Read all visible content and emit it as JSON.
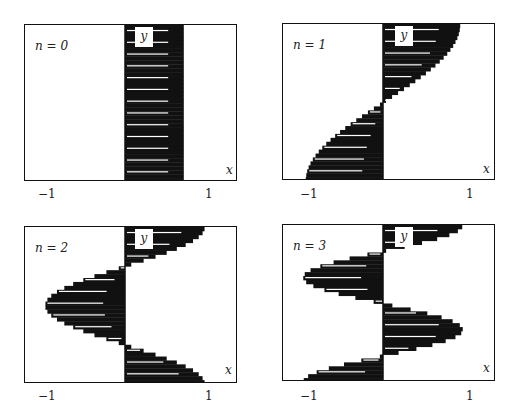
{
  "chart_data": [
    {
      "type": "area",
      "title": "n = 0",
      "n_label": "n = 0",
      "xlabel": "x",
      "ylabel": "y",
      "x_ticks": [
        "−1",
        "1"
      ],
      "xlim": [
        -1.4,
        1.4
      ],
      "ylim": [
        0,
        1
      ],
      "shape": "band",
      "description": "Filled band between x = 0 and x ≈ 0.75 over full y range",
      "left_edge": [
        [
          0,
          0
        ],
        [
          0,
          1
        ]
      ],
      "right_edge": [
        [
          0.75,
          0
        ],
        [
          0.75,
          1
        ]
      ]
    },
    {
      "type": "area",
      "title": "n = 1",
      "n_label": "n = 1",
      "xlabel": "x",
      "ylabel": "y",
      "x_ticks": [
        "−1",
        "1"
      ],
      "xlim": [
        -1.4,
        1.4
      ],
      "ylim": [
        0,
        1
      ],
      "shape": "cosine-half",
      "description": "Filled region between x=0 and curve x = cos(pi*y): positive at top, negative at bottom"
    },
    {
      "type": "area",
      "title": "n = 2",
      "n_label": "n = 2",
      "xlabel": "x",
      "ylabel": "y",
      "x_ticks": [
        "−1",
        "1"
      ],
      "xlim": [
        -1.4,
        1.4
      ],
      "ylim": [
        0,
        1
      ],
      "shape": "cosine-full",
      "description": "Filled region between x=0 and curve x = cos(2*pi*y)"
    },
    {
      "type": "area",
      "title": "n = 3",
      "n_label": "n = 3",
      "xlabel": "x",
      "ylabel": "y",
      "x_ticks": [
        "−1",
        "1"
      ],
      "xlim": [
        -1.4,
        1.4
      ],
      "ylim": [
        0,
        1
      ],
      "shape": "cosine-1.5",
      "description": "Filled region between x=0 and curve x = cos(3*pi*y)"
    }
  ],
  "panels": [
    {
      "n": "n = 0",
      "y": "y",
      "x": "x",
      "tneg": "−1",
      "tpos": "1"
    },
    {
      "n": "n = 1",
      "y": "y",
      "x": "x",
      "tneg": "−1",
      "tpos": "1"
    },
    {
      "n": "n = 2",
      "y": "y",
      "x": "x",
      "tneg": "−1",
      "tpos": "1"
    },
    {
      "n": "n = 3",
      "y": "y",
      "x": "x",
      "tneg": "−1",
      "tpos": "1"
    }
  ]
}
